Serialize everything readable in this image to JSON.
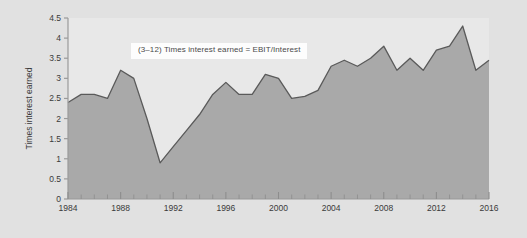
{
  "figure": {
    "background_color": "#e1e1e1",
    "plot_background_color": "#e8e8e8",
    "area_fill_color": "#a9a9a9",
    "line_color": "#5a5a5a",
    "axis_color": "#9a9a9a",
    "text_color": "#3a3a3a",
    "annotation": {
      "text": "(3–12) Times interest earned = EBIT/Interest",
      "background_color": "#fdfdfd"
    }
  },
  "chart_data": {
    "type": "area",
    "title": "",
    "subtitle": "",
    "xlabel": "",
    "ylabel": "Times interest earned",
    "xlim": [
      1984,
      2016
    ],
    "ylim": [
      0,
      4.5
    ],
    "grid": false,
    "legend": null,
    "annotations": [
      {
        "text": "(3–12) Times interest earned = EBIT/Interest",
        "x": 1992,
        "y": 4.15
      }
    ],
    "ytick_labels": [
      "0",
      "0.5",
      "1",
      "1.5",
      "2",
      "2.5",
      "3",
      "3.5",
      "4",
      "4.5"
    ],
    "yticks": [
      0,
      0.5,
      1,
      1.5,
      2,
      2.5,
      3,
      3.5,
      4,
      4.5
    ],
    "xtick_labels": [
      "1984",
      "1988",
      "1992",
      "1996",
      "2000",
      "2004",
      "2008",
      "2012",
      "2016"
    ],
    "xticks": [
      1984,
      1988,
      1992,
      1996,
      2000,
      2004,
      2008,
      2012,
      2016
    ],
    "x_minor_tick_interval": 1,
    "series": [
      {
        "name": "Times interest earned",
        "x": [
          1984,
          1985,
          1986,
          1987,
          1988,
          1989,
          1990,
          1991,
          1992,
          1993,
          1994,
          1995,
          1996,
          1997,
          1998,
          1999,
          2000,
          2001,
          2002,
          2003,
          2004,
          2005,
          2006,
          2007,
          2008,
          2009,
          2010,
          2011,
          2012,
          2013,
          2014,
          2015,
          2016
        ],
        "values": [
          2.4,
          2.6,
          2.6,
          2.5,
          3.2,
          3.0,
          2.0,
          0.9,
          1.3,
          1.7,
          2.1,
          2.6,
          2.9,
          2.6,
          2.6,
          3.1,
          3.0,
          2.5,
          2.55,
          2.7,
          3.3,
          3.45,
          3.3,
          3.5,
          3.8,
          3.2,
          3.5,
          3.2,
          3.7,
          3.8,
          4.3,
          3.2,
          3.45
        ]
      }
    ]
  }
}
